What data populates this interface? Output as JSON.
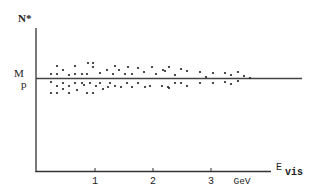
{
  "chart_data": {
    "type": "scatter",
    "title": "",
    "xlabel": "E_vis",
    "xlabel_main": "E",
    "xlabel_sub": "vis",
    "x_unit": "GeV",
    "ylabel": "N*",
    "reference_line": {
      "label_main": "M",
      "label_sub": "p",
      "description": "horizontal line at proton mass M_p"
    },
    "x_ticks": [
      1,
      2,
      3
    ],
    "x_tick_labels": [
      "1",
      "2",
      "3"
    ],
    "xlim": [
      0,
      4.0
    ],
    "ylim_description": "arbitrary; points cluster around M_p",
    "grid": false,
    "legend": "none",
    "colors": {
      "axis": "#333333",
      "points": "#222222",
      "background": "#ffffff"
    },
    "points_px": [
      [
        57,
        66
      ],
      [
        75,
        66
      ],
      [
        88,
        63
      ],
      [
        93,
        63
      ],
      [
        93,
        67
      ],
      [
        63,
        70
      ],
      [
        51,
        74
      ],
      [
        57,
        74
      ],
      [
        69,
        75
      ],
      [
        75,
        74
      ],
      [
        82,
        74
      ],
      [
        87,
        74
      ],
      [
        100,
        73
      ],
      [
        107,
        70
      ],
      [
        113,
        74
      ],
      [
        115,
        66
      ],
      [
        119,
        70
      ],
      [
        125,
        74
      ],
      [
        128,
        67
      ],
      [
        132,
        74
      ],
      [
        138,
        68
      ],
      [
        144,
        72
      ],
      [
        152,
        67
      ],
      [
        156,
        74
      ],
      [
        163,
        70
      ],
      [
        165,
        71
      ],
      [
        169,
        67
      ],
      [
        175,
        75
      ],
      [
        181,
        69
      ],
      [
        187,
        71
      ],
      [
        200,
        72
      ],
      [
        206,
        77
      ],
      [
        213,
        73
      ],
      [
        225,
        73
      ],
      [
        231,
        75
      ],
      [
        238,
        72
      ],
      [
        244,
        76
      ],
      [
        250,
        78
      ],
      [
        51,
        82
      ],
      [
        57,
        86
      ],
      [
        63,
        83
      ],
      [
        69,
        86
      ],
      [
        75,
        83
      ],
      [
        82,
        83
      ],
      [
        84,
        85
      ],
      [
        90,
        83
      ],
      [
        96,
        86
      ],
      [
        100,
        83
      ],
      [
        110,
        83
      ],
      [
        115,
        86
      ],
      [
        121,
        87
      ],
      [
        127,
        83
      ],
      [
        132,
        87
      ],
      [
        138,
        83
      ],
      [
        145,
        87
      ],
      [
        150,
        86
      ],
      [
        162,
        86
      ],
      [
        168,
        87
      ],
      [
        169,
        88
      ],
      [
        175,
        83
      ],
      [
        181,
        83
      ],
      [
        187,
        86
      ],
      [
        200,
        83
      ],
      [
        213,
        83
      ],
      [
        225,
        82
      ],
      [
        231,
        84
      ],
      [
        238,
        81
      ],
      [
        51,
        93
      ],
      [
        57,
        93
      ],
      [
        63,
        89
      ],
      [
        69,
        93
      ],
      [
        77,
        90
      ],
      [
        87,
        93
      ],
      [
        93,
        93
      ],
      [
        103,
        89
      ],
      [
        108,
        87
      ]
    ]
  },
  "axes": {
    "y_label_main": "N*",
    "x_label_main": "E",
    "x_label_sub": "vis",
    "x_unit": "GeV",
    "ref_label_main": "M",
    "ref_label_sub": "p",
    "tick_labels": [
      "1",
      "2",
      "3"
    ]
  }
}
